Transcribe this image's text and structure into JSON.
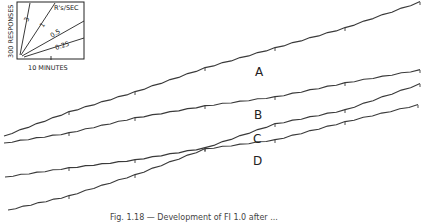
{
  "chart_data": {
    "type": "line",
    "title": "",
    "caption": "Fig. 1.18 — Development of FI 1.0 after ...",
    "xlabel": "",
    "ylabel": "",
    "grid": false,
    "tick_spacing_px": 70,
    "series": [
      {
        "name": "A",
        "label_pos": [
          255,
          76
        ],
        "points": [
          [
            4,
            136
          ],
          [
            69,
            112
          ],
          [
            135,
            92
          ],
          [
            205,
            68
          ],
          [
            275,
            48
          ],
          [
            345,
            28
          ],
          [
            420,
            2
          ]
        ]
      },
      {
        "name": "B",
        "label_pos": [
          254,
          119
        ],
        "points": [
          [
            4,
            143
          ],
          [
            69,
            133
          ],
          [
            135,
            118
          ],
          [
            205,
            106
          ],
          [
            275,
            97
          ],
          [
            345,
            83
          ],
          [
            420,
            70
          ]
        ]
      },
      {
        "name": "C",
        "label_pos": [
          253,
          143
        ],
        "points": [
          [
            5,
            177
          ],
          [
            69,
            168
          ],
          [
            135,
            160
          ],
          [
            205,
            148
          ],
          [
            275,
            124
          ],
          [
            345,
            110
          ],
          [
            420,
            84
          ]
        ]
      },
      {
        "name": "D",
        "label_pos": [
          253,
          165
        ],
        "points": [
          [
            8,
            210
          ],
          [
            69,
            196
          ],
          [
            135,
            175
          ],
          [
            205,
            149
          ],
          [
            275,
            140
          ],
          [
            345,
            122
          ],
          [
            418,
            105
          ]
        ]
      }
    ],
    "inset": {
      "title": "R's/SEC",
      "ylabel": "300 RESPONSES",
      "xlabel": "10 MINUTES",
      "rates": [
        {
          "label": "3",
          "end": [
            30,
            3
          ]
        },
        {
          "label": "1",
          "end": [
            55,
            3
          ]
        },
        {
          "label": "0.5",
          "end": [
            84,
            22
          ]
        },
        {
          "label": "0.25",
          "end": [
            84,
            40
          ]
        }
      ]
    }
  }
}
